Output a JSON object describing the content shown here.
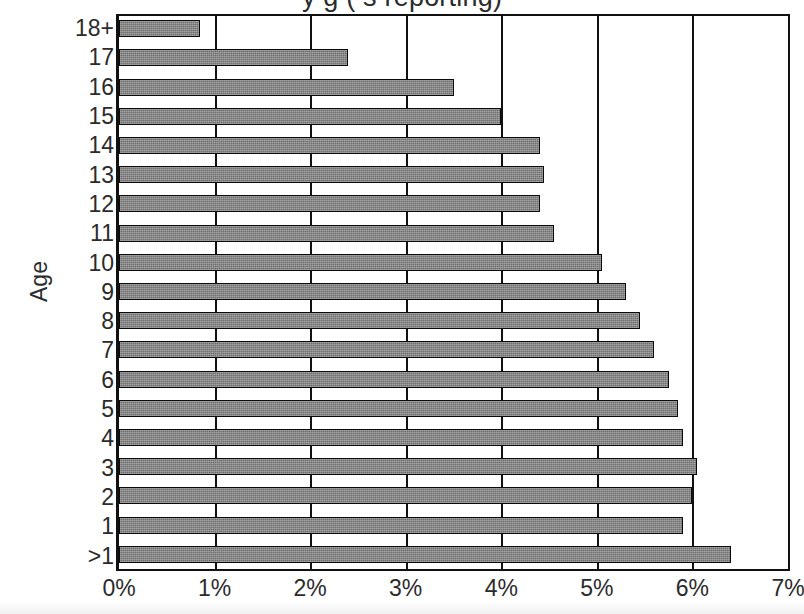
{
  "chart_data": {
    "type": "bar",
    "orientation": "horizontal",
    "title_visible_fragment": "y  g  (        s reporting)",
    "title_clipped": true,
    "xlabel": "",
    "ylabel": "Age",
    "categories": [
      "18+",
      "17",
      "16",
      "15",
      "14",
      "13",
      "12",
      "11",
      "10",
      "9",
      "8",
      "7",
      "6",
      "5",
      "4",
      "3",
      "2",
      "1",
      ">1"
    ],
    "values": [
      0.85,
      2.4,
      3.5,
      4.0,
      4.4,
      4.45,
      4.4,
      4.55,
      5.05,
      5.3,
      5.45,
      5.6,
      5.75,
      5.85,
      5.9,
      6.05,
      6.0,
      5.9,
      6.4
    ],
    "value_unit": "%",
    "xlim": [
      0,
      7
    ],
    "xticks": [
      0,
      1,
      2,
      3,
      4,
      5,
      6,
      7
    ],
    "xtick_labels": [
      "0%",
      "1%",
      "2%",
      "3%",
      "4%",
      "5%",
      "6%",
      "7%"
    ],
    "grid": "vertical",
    "legend": null,
    "bar_color": "#6e6e6e",
    "bar_border_color": "#0b0b0b",
    "frame_color": "#111111"
  },
  "axes": {
    "y_title": "Age",
    "x_tick_labels": [
      "0%",
      "1%",
      "2%",
      "3%",
      "4%",
      "5%",
      "6%",
      "7%"
    ]
  },
  "title": {
    "text": "y age (mothers reporting)"
  }
}
